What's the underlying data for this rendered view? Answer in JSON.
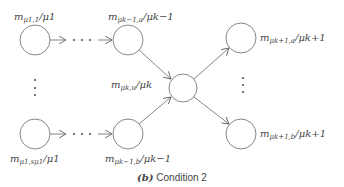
{
  "figure": {
    "caption_tag": "(b)",
    "caption_text": "Condition 2",
    "nodes": [
      {
        "id": "top-left",
        "main": "m",
        "sub": "μ1,1",
        "den": "μ1"
      },
      {
        "id": "top-mid",
        "main": "m",
        "sub": "μk−1,a",
        "den": "μk−1"
      },
      {
        "id": "center",
        "main": "m",
        "sub": "μk,u",
        "den": "μk"
      },
      {
        "id": "top-right",
        "main": "m",
        "sub": "μk+1,a",
        "den": "μk+1"
      },
      {
        "id": "bottom-left",
        "main": "m",
        "sub": "μ1,sμ1",
        "den": "μ1"
      },
      {
        "id": "bottom-mid",
        "main": "m",
        "sub": "μk−1,b",
        "den": "μk−1"
      },
      {
        "id": "bottom-right",
        "main": "m",
        "sub": "μk+1,b",
        "den": "μk+1"
      }
    ],
    "ellipsis_horizontal": "· · ·",
    "ellipsis_vertical": "⋮",
    "colors": {
      "line": "#777777",
      "text": "#444444",
      "background": "#ffffff"
    }
  }
}
